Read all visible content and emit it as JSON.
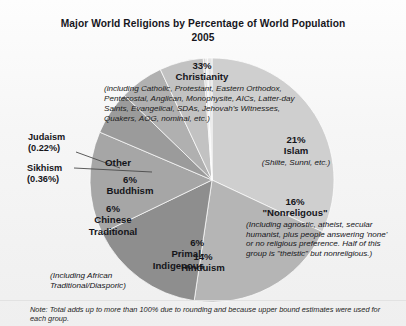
{
  "header": {
    "title_line1": "Major World Religions by Percentage of World Population",
    "title_line2": "2005"
  },
  "labels": {
    "christianity": {
      "pct": "33%",
      "name": "Christianity",
      "detail": "(including Catholic, Protestant, Eastern Orthodox, Pentecostal, Anglican, Monophysite, AICs, Latter-day Saints, Evangelical, SDAs, Jehovah's Witnesses, Quakers, AOG, nominal, etc.)"
    },
    "islam": {
      "pct": "21%",
      "name": "Islam",
      "detail": "(Shiite, Sunni, etc.)"
    },
    "nonreligious": {
      "pct": "16%",
      "name": "\"Nonreligous\"",
      "detail": "(Including agnostic, atheist, secular humanist, plus people answering 'none' or no religious preference. Half of this group is \"theistic\" but nonreligious.)"
    },
    "hinduism": {
      "pct": "14%",
      "name": "Hinduism"
    },
    "primal": {
      "pct": "6%",
      "name_line1": "Primal-",
      "name_line2": "Indigenous",
      "detail": "(Including African Traditional/Diasporic)"
    },
    "chinese": {
      "pct": "6%",
      "name_line1": "Chinese",
      "name_line2": "Traditional"
    },
    "buddhism": {
      "pct": "6%",
      "name": "Buddhism"
    },
    "other": {
      "name": "Other"
    },
    "judaism": {
      "name": "Judaism",
      "pct": "(0.22%)"
    },
    "sikhism": {
      "name": "Sikhism",
      "pct": "(0.36%)"
    }
  },
  "footnote": {
    "text": "Note: Total adds up to more than 100% due to rounding and because upper bound estimates were used for each group."
  },
  "chart_data": {
    "type": "pie",
    "title": "Major World Religions by Percentage of World Population 2005",
    "unit": "percent of world population",
    "start_angle_deg": 0,
    "direction": "clockwise",
    "center": [
      212,
      180
    ],
    "radius": 122,
    "legend": "none",
    "grid": false,
    "categories": [
      "Christianity",
      "Islam",
      "\"Nonreligous\"",
      "Hinduism",
      "Primal-Indigenous",
      "Chinese Traditional",
      "Buddhism",
      "Sikhism",
      "Judaism",
      "Other"
    ],
    "values": [
      33,
      21,
      16,
      14,
      6,
      6,
      6,
      0.36,
      0.22,
      0.6
    ],
    "colors": [
      "#cfcfcf",
      "#b5b5b5",
      "#8e8e8e",
      "#a6a6a6",
      "#9b9b9b",
      "#b0b0b0",
      "#c2c2c2",
      "#d6d6d6",
      "#dedede",
      "#e4e4e4"
    ],
    "slice_labels": [
      "33% Christianity",
      "21% Islam",
      "16% \"Nonreligous\"",
      "14% Hinduism",
      "6% Primal-Indigenous",
      "6% Chinese Traditional",
      "6% Buddhism",
      "Sikhism (0.36%)",
      "Judaism (0.22%)",
      "Other"
    ]
  }
}
